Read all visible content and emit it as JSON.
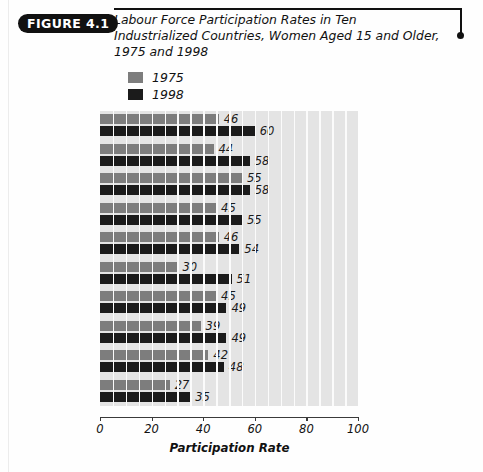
{
  "figure": {
    "badge": "FIGURE 4.1",
    "title_line1": "Labour Force Participation Rates in Ten Industrialized Countries,",
    "title_line2": "Women Aged 15 and Older, 1975 and 1998"
  },
  "legend": {
    "items": [
      {
        "label": "1975",
        "color": "#7d7d7d"
      },
      {
        "label": "1998",
        "color": "#1b1b1b"
      }
    ]
  },
  "axis": {
    "title": "Participation Rate",
    "ticks": [
      "0",
      "20",
      "40",
      "60",
      "80",
      "100"
    ]
  },
  "chart_data": {
    "type": "bar",
    "orientation": "horizontal",
    "title": "Labour Force Participation Rates in Ten Industrialized Countries, Women Aged 15 and Older, 1975 and 1998",
    "xlabel": "Participation Rate",
    "ylabel": "",
    "xlim": [
      0,
      100
    ],
    "grid": true,
    "legend_position": "top-left",
    "categories": [
      "United States",
      "Canada",
      "Sweden",
      "Australia",
      "United Kingdom",
      "Netherlands",
      "Japan",
      "Germany*",
      "France",
      "Italy"
    ],
    "series": [
      {
        "name": "1975",
        "color": "#7d7d7d",
        "values": [
          46,
          44,
          55,
          45,
          46,
          30,
          45,
          39,
          42,
          27
        ]
      },
      {
        "name": "1998",
        "color": "#1b1b1b",
        "values": [
          60,
          58,
          58,
          55,
          54,
          51,
          49,
          49,
          48,
          35
        ]
      }
    ]
  }
}
